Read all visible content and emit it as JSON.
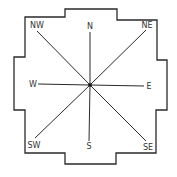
{
  "diagram": {
    "type": "compass-rose",
    "colors": {
      "line": "#2a2a2a",
      "text": "#333333",
      "background": "#ffffff"
    },
    "outline_points": "65,9 117,9 117,20 157,20 157,60 167,60 167,110 156,110 156,153 116,153 116,164 65,164 65,153 25,153 25,110 14,110 14,57 25,57 25,17 65,17",
    "center": {
      "x": 90,
      "y": 85
    },
    "directions": [
      {
        "id": "n",
        "label": "N",
        "end": [
          90,
          32
        ],
        "text": [
          90,
          29
        ],
        "anchor": "middle"
      },
      {
        "id": "ne",
        "label": "NE",
        "end": [
          146,
          30
        ],
        "text": [
          147,
          28
        ],
        "anchor": "middle"
      },
      {
        "id": "e",
        "label": "E",
        "end": [
          144,
          86
        ],
        "text": [
          149,
          89
        ],
        "anchor": "middle"
      },
      {
        "id": "se",
        "label": "SE",
        "end": [
          146,
          141
        ],
        "text": [
          148,
          150
        ],
        "anchor": "middle"
      },
      {
        "id": "s",
        "label": "S",
        "end": [
          89,
          141
        ],
        "text": [
          89,
          149
        ],
        "anchor": "middle"
      },
      {
        "id": "sw",
        "label": "SW",
        "end": [
          35,
          138
        ],
        "text": [
          34,
          148
        ],
        "anchor": "middle"
      },
      {
        "id": "w",
        "label": "W",
        "end": [
          38,
          84
        ],
        "text": [
          33,
          87
        ],
        "anchor": "middle"
      },
      {
        "id": "nw",
        "label": "NW",
        "end": [
          37,
          31
        ],
        "text": [
          37,
          28
        ],
        "anchor": "middle"
      }
    ]
  }
}
